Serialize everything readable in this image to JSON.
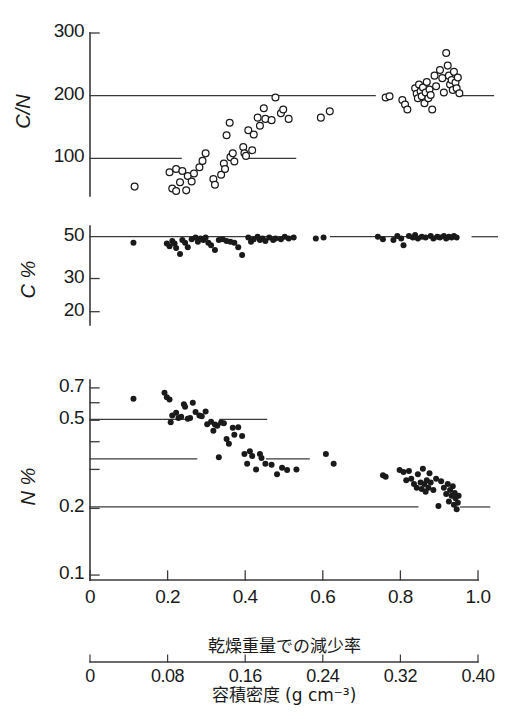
{
  "figure": {
    "panels": [
      {
        "id": "cn",
        "ylabel": "C/N",
        "yticks": [
          {
            "value": 100,
            "label": "100"
          },
          {
            "value": 200,
            "label": "200"
          },
          {
            "value": 300,
            "label": "300"
          }
        ],
        "ylim": [
          40,
          300
        ],
        "scale": "linear",
        "marker": "open-circle",
        "reference_lines": [
          {
            "value": 200,
            "segments": [
              [
                0.0,
                0.735
              ],
              [
                0.955,
                1.04
              ]
            ]
          },
          {
            "value": 100,
            "segments": [
              [
                0.0,
                0.235
              ],
              [
                0.4,
                0.53
              ]
            ]
          }
        ]
      },
      {
        "id": "c",
        "ylabel": "C %",
        "yticks": [
          {
            "value": 20,
            "label": "20"
          },
          {
            "value": 30,
            "label": "30"
          },
          {
            "value": 50,
            "label": "50"
          }
        ],
        "ylim": [
          17,
          57
        ],
        "scale": "log",
        "marker": "filled-circle",
        "reference_lines": [
          {
            "value": 50,
            "segments": [
              [
                0.0,
                0.52
              ],
              [
                0.62,
                0.9
              ],
              [
                0.985,
                1.05
              ]
            ]
          }
        ]
      },
      {
        "id": "n",
        "ylabel": "N %",
        "yticks": [
          {
            "value": 0.1,
            "label": "0.1"
          },
          {
            "value": 0.2,
            "label": "0.2"
          },
          {
            "value": 0.3,
            "label": ""
          },
          {
            "value": 0.4,
            "label": ""
          },
          {
            "value": 0.5,
            "label": "0.5"
          },
          {
            "value": 0.6,
            "label": ""
          },
          {
            "value": 0.7,
            "label": "0.7"
          }
        ],
        "ylim": [
          0.095,
          0.76
        ],
        "scale": "log",
        "marker": "filled-circle",
        "reference_lines": [
          {
            "value": 0.505,
            "segments": [
              [
                0.0,
                0.245
              ],
              [
                0.335,
                0.455
              ]
            ]
          },
          {
            "value": 0.335,
            "segments": [
              [
                0.0,
                0.275
              ],
              [
                0.455,
                0.565
              ]
            ]
          },
          {
            "value": 0.203,
            "segments": [
              [
                0.0,
                0.845
              ],
              [
                0.955,
                1.03
              ]
            ]
          }
        ]
      }
    ],
    "xaxis_primary": {
      "title": "乾燥重量での減少率",
      "ticks": [
        {
          "value": 0.0,
          "label": "0"
        },
        {
          "value": 0.2,
          "label": "0.2"
        },
        {
          "value": 0.4,
          "label": "0.4"
        },
        {
          "value": 0.6,
          "label": "0.6"
        },
        {
          "value": 0.8,
          "label": "0.8"
        },
        {
          "value": 1.0,
          "label": "1.0"
        }
      ],
      "range": [
        0,
        1.0
      ]
    },
    "xaxis_secondary": {
      "title": "容積密度 (g cm⁻³)",
      "ticks": [
        {
          "value": 0.0,
          "label": "0"
        },
        {
          "value": 0.2,
          "label": "0.08"
        },
        {
          "value": 0.4,
          "label": "0.16"
        },
        {
          "value": 0.6,
          "label": "0.24"
        },
        {
          "value": 0.8,
          "label": "0.32"
        },
        {
          "value": 1.0,
          "label": "0.40"
        }
      ],
      "range": [
        0,
        0.4
      ]
    },
    "colors": {
      "ink": "#1a1a1a",
      "line": "#3a3a3a",
      "background": "#ffffff"
    }
  },
  "chart_data": [
    {
      "type": "scatter",
      "title": "C/N vs dry weight loss rate",
      "xlabel": "乾燥重量での減少率",
      "ylabel": "C/N",
      "ylim": [
        40,
        300
      ],
      "xlim": [
        0,
        1.0
      ],
      "grid": false,
      "marker": "open-circle",
      "points": [
        [
          0.115,
          55
        ],
        [
          0.212,
          52
        ],
        [
          0.222,
          48
        ],
        [
          0.232,
          62
        ],
        [
          0.248,
          49
        ],
        [
          0.205,
          78
        ],
        [
          0.222,
          83
        ],
        [
          0.238,
          80
        ],
        [
          0.252,
          72
        ],
        [
          0.268,
          76
        ],
        [
          0.282,
          86
        ],
        [
          0.262,
          63
        ],
        [
          0.29,
          96
        ],
        [
          0.298,
          108
        ],
        [
          0.318,
          67
        ],
        [
          0.322,
          58
        ],
        [
          0.338,
          74
        ],
        [
          0.345,
          92
        ],
        [
          0.348,
          83
        ],
        [
          0.352,
          137
        ],
        [
          0.36,
          157
        ],
        [
          0.362,
          102
        ],
        [
          0.368,
          108
        ],
        [
          0.372,
          95
        ],
        [
          0.395,
          118
        ],
        [
          0.398,
          108
        ],
        [
          0.402,
          104
        ],
        [
          0.408,
          145
        ],
        [
          0.418,
          113
        ],
        [
          0.422,
          138
        ],
        [
          0.432,
          165
        ],
        [
          0.438,
          152
        ],
        [
          0.448,
          180
        ],
        [
          0.452,
          163
        ],
        [
          0.468,
          161
        ],
        [
          0.478,
          197
        ],
        [
          0.492,
          172
        ],
        [
          0.498,
          178
        ],
        [
          0.512,
          163
        ],
        [
          0.595,
          165
        ],
        [
          0.618,
          175
        ],
        [
          0.762,
          197
        ],
        [
          0.772,
          199
        ],
        [
          0.805,
          193
        ],
        [
          0.812,
          186
        ],
        [
          0.818,
          178
        ],
        [
          0.838,
          212
        ],
        [
          0.842,
          203
        ],
        [
          0.845,
          196
        ],
        [
          0.848,
          218
        ],
        [
          0.852,
          207
        ],
        [
          0.855,
          199
        ],
        [
          0.858,
          213
        ],
        [
          0.862,
          188
        ],
        [
          0.865,
          205
        ],
        [
          0.868,
          222
        ],
        [
          0.872,
          196
        ],
        [
          0.875,
          210
        ],
        [
          0.878,
          201
        ],
        [
          0.882,
          178
        ],
        [
          0.888,
          232
        ],
        [
          0.892,
          215
        ],
        [
          0.902,
          241
        ],
        [
          0.908,
          228
        ],
        [
          0.912,
          205
        ],
        [
          0.918,
          268
        ],
        [
          0.922,
          248
        ],
        [
          0.925,
          232
        ],
        [
          0.928,
          218
        ],
        [
          0.932,
          225
        ],
        [
          0.935,
          209
        ],
        [
          0.938,
          238
        ],
        [
          0.942,
          221
        ],
        [
          0.945,
          212
        ],
        [
          0.948,
          229
        ],
        [
          0.952,
          204
        ]
      ]
    },
    {
      "type": "scatter",
      "title": "C % vs dry weight loss rate",
      "xlabel": "乾燥重量での減少率",
      "ylabel": "C %",
      "ylim": [
        17,
        57
      ],
      "xlim": [
        0,
        1.0
      ],
      "yscale": "log",
      "grid": false,
      "marker": "filled-circle",
      "points": [
        [
          0.112,
          46.5
        ],
        [
          0.198,
          46.0
        ],
        [
          0.205,
          44.5
        ],
        [
          0.212,
          47.5
        ],
        [
          0.218,
          46.0
        ],
        [
          0.222,
          43.5
        ],
        [
          0.232,
          40.5
        ],
        [
          0.238,
          48.0
        ],
        [
          0.245,
          46.5
        ],
        [
          0.252,
          44.0
        ],
        [
          0.262,
          48.5
        ],
        [
          0.272,
          49.5
        ],
        [
          0.278,
          47.0
        ],
        [
          0.285,
          49.0
        ],
        [
          0.292,
          48.0
        ],
        [
          0.298,
          49.5
        ],
        [
          0.305,
          46.5
        ],
        [
          0.312,
          45.0
        ],
        [
          0.322,
          42.5
        ],
        [
          0.332,
          48.0
        ],
        [
          0.342,
          48.5
        ],
        [
          0.352,
          47.5
        ],
        [
          0.362,
          47.0
        ],
        [
          0.372,
          46.5
        ],
        [
          0.382,
          44.0
        ],
        [
          0.392,
          40.0
        ],
        [
          0.408,
          49.5
        ],
        [
          0.415,
          47.0
        ],
        [
          0.422,
          48.5
        ],
        [
          0.432,
          50.0
        ],
        [
          0.438,
          48.0
        ],
        [
          0.445,
          49.0
        ],
        [
          0.452,
          47.5
        ],
        [
          0.462,
          49.5
        ],
        [
          0.472,
          48.0
        ],
        [
          0.478,
          49.0
        ],
        [
          0.492,
          48.5
        ],
        [
          0.502,
          50.0
        ],
        [
          0.512,
          49.0
        ],
        [
          0.525,
          49.5
        ],
        [
          0.582,
          49.0
        ],
        [
          0.602,
          49.5
        ],
        [
          0.742,
          50.0
        ],
        [
          0.755,
          48.5
        ],
        [
          0.782,
          48.0
        ],
        [
          0.792,
          50.5
        ],
        [
          0.802,
          49.0
        ],
        [
          0.808,
          45.0
        ],
        [
          0.822,
          50.5
        ],
        [
          0.832,
          49.5
        ],
        [
          0.838,
          51.0
        ],
        [
          0.845,
          49.0
        ],
        [
          0.855,
          50.0
        ],
        [
          0.865,
          49.5
        ],
        [
          0.878,
          50.5
        ],
        [
          0.885,
          49.0
        ],
        [
          0.895,
          50.0
        ],
        [
          0.902,
          49.5
        ],
        [
          0.912,
          50.5
        ],
        [
          0.918,
          49.0
        ],
        [
          0.925,
          50.0
        ],
        [
          0.932,
          49.5
        ],
        [
          0.938,
          50.5
        ],
        [
          0.945,
          49.5
        ]
      ]
    },
    {
      "type": "scatter",
      "title": "N % vs dry weight loss rate",
      "xlabel": "乾燥重量での減少率",
      "ylabel": "N %",
      "ylim": [
        0.095,
        0.76
      ],
      "xlim": [
        0,
        1.0
      ],
      "yscale": "log",
      "grid": false,
      "marker": "filled-circle",
      "points": [
        [
          0.112,
          0.625
        ],
        [
          0.192,
          0.665
        ],
        [
          0.198,
          0.635
        ],
        [
          0.205,
          0.62
        ],
        [
          0.208,
          0.49
        ],
        [
          0.212,
          0.525
        ],
        [
          0.222,
          0.54
        ],
        [
          0.228,
          0.512
        ],
        [
          0.235,
          0.518
        ],
        [
          0.242,
          0.59
        ],
        [
          0.245,
          0.575
        ],
        [
          0.252,
          0.508
        ],
        [
          0.258,
          0.512
        ],
        [
          0.265,
          0.6
        ],
        [
          0.272,
          0.545
        ],
        [
          0.282,
          0.525
        ],
        [
          0.288,
          0.522
        ],
        [
          0.298,
          0.548
        ],
        [
          0.302,
          0.48
        ],
        [
          0.312,
          0.492
        ],
        [
          0.318,
          0.448
        ],
        [
          0.322,
          0.478
        ],
        [
          0.328,
          0.472
        ],
        [
          0.332,
          0.34
        ],
        [
          0.338,
          0.488
        ],
        [
          0.345,
          0.485
        ],
        [
          0.352,
          0.412
        ],
        [
          0.358,
          0.392
        ],
        [
          0.368,
          0.462
        ],
        [
          0.372,
          0.43
        ],
        [
          0.382,
          0.465
        ],
        [
          0.392,
          0.425
        ],
        [
          0.398,
          0.352
        ],
        [
          0.405,
          0.318
        ],
        [
          0.412,
          0.362
        ],
        [
          0.418,
          0.345
        ],
        [
          0.428,
          0.3
        ],
        [
          0.438,
          0.352
        ],
        [
          0.442,
          0.338
        ],
        [
          0.452,
          0.318
        ],
        [
          0.468,
          0.315
        ],
        [
          0.482,
          0.285
        ],
        [
          0.495,
          0.305
        ],
        [
          0.508,
          0.298
        ],
        [
          0.532,
          0.3
        ],
        [
          0.608,
          0.352
        ],
        [
          0.628,
          0.318
        ],
        [
          0.755,
          0.282
        ],
        [
          0.762,
          0.278
        ],
        [
          0.798,
          0.298
        ],
        [
          0.808,
          0.292
        ],
        [
          0.815,
          0.268
        ],
        [
          0.822,
          0.295
        ],
        [
          0.828,
          0.272
        ],
        [
          0.835,
          0.258
        ],
        [
          0.842,
          0.248
        ],
        [
          0.845,
          0.285
        ],
        [
          0.852,
          0.262
        ],
        [
          0.855,
          0.245
        ],
        [
          0.858,
          0.302
        ],
        [
          0.862,
          0.258
        ],
        [
          0.865,
          0.238
        ],
        [
          0.868,
          0.268
        ],
        [
          0.872,
          0.248
        ],
        [
          0.875,
          0.288
        ],
        [
          0.878,
          0.262
        ],
        [
          0.885,
          0.242
        ],
        [
          0.892,
          0.272
        ],
        [
          0.898,
          0.205
        ],
        [
          0.905,
          0.265
        ],
        [
          0.912,
          0.248
        ],
        [
          0.918,
          0.232
        ],
        [
          0.922,
          0.258
        ],
        [
          0.925,
          0.215
        ],
        [
          0.928,
          0.242
        ],
        [
          0.932,
          0.228
        ],
        [
          0.935,
          0.252
        ],
        [
          0.938,
          0.208
        ],
        [
          0.94,
          0.235
        ],
        [
          0.942,
          0.222
        ],
        [
          0.945,
          0.198
        ],
        [
          0.948,
          0.212
        ],
        [
          0.95,
          0.228
        ]
      ]
    }
  ]
}
